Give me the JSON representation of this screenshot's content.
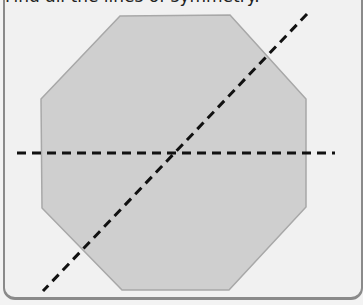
{
  "question": {
    "prompt": "Find all the lines of symmetry."
  },
  "figure": {
    "shape": "regular-octagon",
    "fill": "#cfcfcf",
    "stroke": "#a8a8a8",
    "background": "#f1f1f1",
    "vertices": [
      [
        120,
        16
      ],
      [
        230,
        15
      ],
      [
        306,
        99
      ],
      [
        306,
        207
      ],
      [
        229,
        290
      ],
      [
        122,
        290
      ],
      [
        42,
        208
      ],
      [
        41,
        99
      ]
    ],
    "symmetry_lines_drawn": [
      {
        "name": "horizontal",
        "x1": 17,
        "y1": 153,
        "x2": 335,
        "y2": 153
      },
      {
        "name": "diagonal",
        "x1": 307,
        "y1": 14,
        "x2": 43,
        "y2": 291
      }
    ],
    "line_color": "#111111"
  }
}
